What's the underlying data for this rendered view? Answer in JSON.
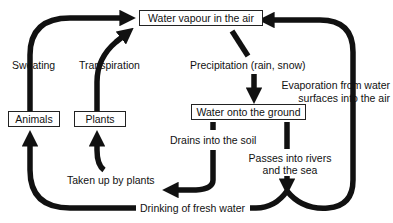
{
  "diagram": {
    "type": "water-cycle",
    "nodes": {
      "vapour": "Water vapour in the air",
      "ground": "Water onto the ground",
      "animals": "Animals",
      "plants": "Plants"
    },
    "edges": {
      "sweating": "Sweating",
      "transpiration": "Transpiration",
      "precipitation": "Precipitation (rain, snow)",
      "evaporation_1": "Evaporation from water",
      "evaporation_2": "surfaces into the air",
      "drains": "Drains into the soil",
      "taken_up": "Taken up by plants",
      "passes_1": "Passes into rivers",
      "passes_2": "and the sea",
      "drinking": "Drinking of fresh water"
    },
    "colors": {
      "stroke": "#111111",
      "background": "#ffffff"
    }
  }
}
